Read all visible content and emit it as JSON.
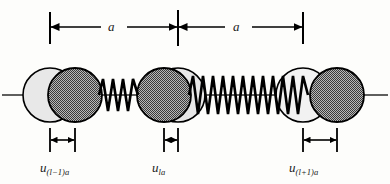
{
  "figure": {
    "background_color": "#fdfdfb",
    "line_color": "#000000",
    "atom_dark_color": "#808080",
    "atom_light_color": "#e8e8e8",
    "baseline_y": 95
  },
  "lattice_spacing": {
    "label_left": "a",
    "label_right": "a",
    "tick_x": [
      50,
      178,
      303
    ],
    "arrow_y": 27,
    "tick_top": 12,
    "tick_bottom": 44
  },
  "atoms": [
    {
      "index": "l-1",
      "equilibrium_x": 50,
      "displaced_x": 75,
      "radius": 27,
      "displacement_label": "u",
      "displacement_subscript": "(l−1)a",
      "dim_y": 140,
      "dim_x_start": 50,
      "dim_x_end": 75,
      "label_x": 40,
      "label_y": 163
    },
    {
      "index": "l",
      "equilibrium_x": 178,
      "displaced_x": 164,
      "radius": 27,
      "displacement_label": "u",
      "displacement_subscript": "la",
      "dim_y": 140,
      "dim_x_start": 164,
      "dim_x_end": 178,
      "label_x": 150,
      "label_y": 163
    },
    {
      "index": "l+1",
      "equilibrium_x": 303,
      "displaced_x": 337,
      "radius": 27,
      "displacement_label": "u",
      "displacement_subscript": "(l+1)a",
      "dim_y": 140,
      "dim_x_start": 303,
      "dim_x_end": 337,
      "label_x": 289,
      "label_y": 163
    }
  ],
  "springs": [
    {
      "from_x": 100,
      "to_x": 139,
      "coils": 4,
      "amplitude": 17,
      "state": "compressed"
    },
    {
      "from_x": 190,
      "to_x": 311,
      "coils": 13,
      "amplitude": 19,
      "state": "stretched"
    }
  ]
}
